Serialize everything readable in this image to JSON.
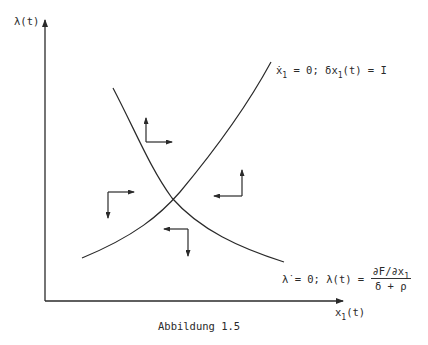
{
  "figure": {
    "caption": "Abbildung 1.5",
    "y_axis_label": "λ(t)",
    "x_axis_label_main": "x",
    "x_axis_label_sub": "1",
    "x_axis_label_tail": "(t)"
  },
  "curves": {
    "rising": {
      "lhs_var": "ẋ",
      "lhs_sub": "1",
      "mid": " = 0; δx",
      "mid_sub": "1",
      "rhs": "(t) = I"
    },
    "falling": {
      "lhs": "λ̇ = 0; λ(t) = ",
      "numerator_main": "∂F/∂x",
      "numerator_sub": "1",
      "denominator": "δ + ρ"
    }
  },
  "phase_arrows": [
    {
      "region": "top",
      "directions": [
        "up",
        "right"
      ]
    },
    {
      "region": "left",
      "directions": [
        "down",
        "right"
      ]
    },
    {
      "region": "right",
      "directions": [
        "up",
        "left"
      ]
    },
    {
      "region": "bottom",
      "directions": [
        "down",
        "left"
      ]
    }
  ],
  "colors": {
    "ink": "#2a2a2a",
    "background": "#ffffff"
  }
}
